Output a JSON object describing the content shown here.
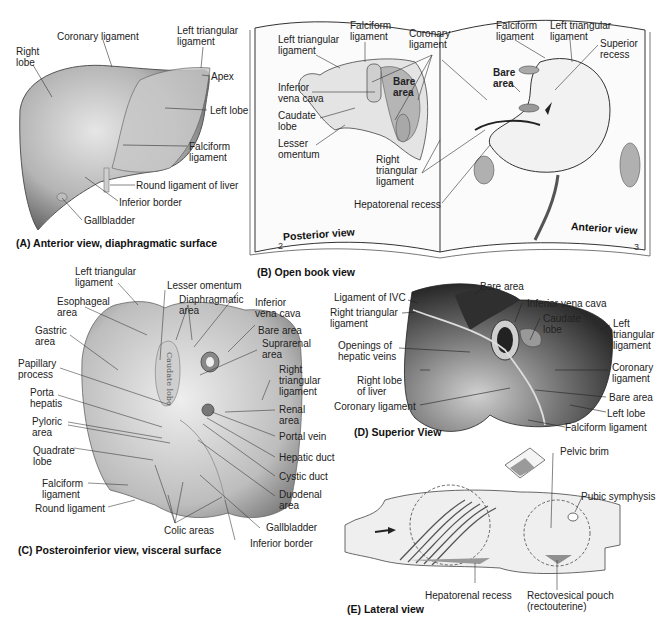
{
  "figure": {
    "panels": [
      {
        "id": "A",
        "caption": "(A) Anterior view, diaphragmatic surface",
        "labels": [
          "Right\nlobe",
          "Coronary ligament",
          "Left triangular\nligament",
          "Apex",
          "Left lobe",
          "Falciform\nligament",
          "Round ligament of liver",
          "Inferior border",
          "Gallbladder"
        ]
      },
      {
        "id": "B",
        "caption": "(B) Open book view",
        "left_page": {
          "view": "Posterior view",
          "page_number": "2",
          "labels": [
            "Left triangular\nligament",
            "Falciform\nligament",
            "Coronary\nligament",
            "Inferior\nvena cava",
            "Bare\narea",
            "Caudate\nlobe",
            "Lesser\nomentum",
            "Right\ntriangular\nligament",
            "Hepatorenal recess"
          ]
        },
        "right_page": {
          "view": "Anterior view",
          "page_number": "3",
          "labels": [
            "Falciform\nligament",
            "Left triangular\nligament",
            "Superior\nrecess",
            "Bare\narea"
          ]
        }
      },
      {
        "id": "C",
        "caption": "(C) Posteroinferior view, visceral surface",
        "labels": [
          "Left triangular\nligament",
          "Esophageal\narea",
          "Gastric\narea",
          "Papillary\nprocess",
          "Porta\nhepatis",
          "Pyloric\narea",
          "Quadrate\nlobe",
          "Falciform\nligament",
          "Round ligament",
          "Lesser omentum",
          "Diaphragmatic\narea",
          "Inferior\nvena cava",
          "Bare area",
          "Suprarenal\narea",
          "Right\ntriangular\nligament",
          "Renal\narea",
          "Portal vein",
          "Hepatic duct",
          "Cystic duct",
          "Duodenal\narea",
          "Gallbladder",
          "Inferior border",
          "Colic areas"
        ],
        "organ_text": "Caudate lobe"
      },
      {
        "id": "D",
        "caption": "(D) Superior View",
        "labels": [
          "Bare area",
          "Ligament of IVC",
          "Inferior vena cava",
          "Right triangular\nligament",
          "Caudate\nlobe",
          "Left\ntriangular\nligament",
          "Openings of\nhepatic veins",
          "Coronary\nligament",
          "Right lobe\nof liver",
          "Bare area",
          "Coronary ligament",
          "Left lobe",
          "Falciform ligament"
        ]
      },
      {
        "id": "E",
        "caption": "(E) Lateral view",
        "labels": [
          "Pelvic brim",
          "Pubic symphysis",
          "Hepatorenal recess",
          "Rectovesical pouch\n(rectouterine)"
        ]
      }
    ]
  },
  "colors": {
    "organ_light": "#d8d8d8",
    "organ_mid": "#a8a8a8",
    "organ_dark": "#555555",
    "fluid": "#9a9a9a",
    "line": "#333333"
  }
}
